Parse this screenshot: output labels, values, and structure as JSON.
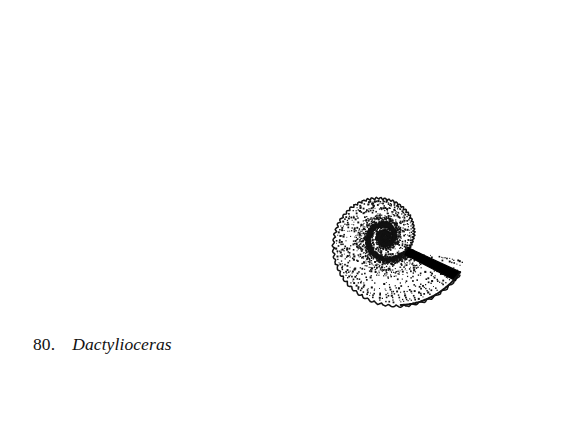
{
  "figure": {
    "number_label": "80.",
    "taxon_name": "Dactylioceras",
    "illustration_style": "stippled pen-and-ink line drawing",
    "background_color": "#ffffff",
    "ink_color": "#111111",
    "stipple_color": "#151515"
  },
  "specimen": {
    "common_name": "ammonite",
    "view": "lateral (side) view of coiled planispiral shell",
    "center_x": 385,
    "center_y": 237,
    "outer_radius": 178,
    "bounds": {
      "left": 205,
      "top": 19,
      "right": 548,
      "bottom": 410
    },
    "whorl_count": 5,
    "rib_count_outer_whorl": 58,
    "aperture": {
      "present": true,
      "description": "solid black wedge marking broken aperture / body chamber edge",
      "angle_degrees": -28,
      "color": "#000000"
    },
    "umbilicus": {
      "description": "tight central coil (protoconch) with dense stippling",
      "radius": 9
    },
    "features": [
      "scalloped crenulated outer margin formed by rib terminations",
      "dense stipple shading along whorl sutures",
      "radial dotted ribs branching outward from umbilical shoulder",
      "logarithmic (equiangular) spiral coiling",
      "solid black aperture wedge at upper right"
    ]
  },
  "chart_data": {
    "type": "scatter",
    "spiral": {
      "kind": "logarithmic",
      "center": [
        385,
        237
      ],
      "a": 8.2,
      "b": 0.1905,
      "theta_start_deg": -460,
      "theta_end_deg": 335
    },
    "whorl_radii": [
      9,
      18,
      35,
      66,
      118,
      178
    ],
    "rib_counts_per_whorl": [
      14,
      20,
      28,
      40,
      58
    ],
    "xlabel": "",
    "ylabel": "",
    "grid": false,
    "legend": "none"
  }
}
